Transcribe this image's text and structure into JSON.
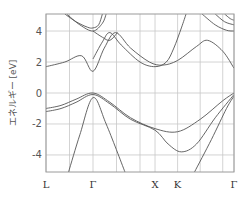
{
  "chart_data": {
    "type": "line",
    "title": "",
    "xlabel": "",
    "ylabel": "エネルギー [eV]",
    "ylim": [
      -5.1,
      5.1
    ],
    "yticks": [
      4,
      2,
      0,
      -2,
      -4
    ],
    "ytick_labels": [
      "4",
      "2",
      "0",
      "-2",
      "-4"
    ],
    "x_points": [
      {
        "label": "L",
        "pos": 0.0
      },
      {
        "label": "Γ",
        "pos": 0.25
      },
      {
        "label": "X",
        "pos": 0.58
      },
      {
        "label": "K",
        "pos": 0.7
      },
      {
        "label": "Γ",
        "pos": 1.0
      }
    ],
    "x_gridlines": [
      0.0,
      0.125,
      0.25,
      0.375,
      0.5,
      0.58,
      0.7,
      0.82,
      0.94,
      1.0
    ],
    "grid": true,
    "legend": null,
    "series": [
      {
        "name": "valence-1",
        "points": [
          [
            0,
            -1.0
          ],
          [
            0.08,
            -0.8
          ],
          [
            0.16,
            -0.4
          ],
          [
            0.25,
            0.0
          ],
          [
            0.34,
            -0.6
          ],
          [
            0.45,
            -1.6
          ],
          [
            0.58,
            -2.3
          ],
          [
            0.7,
            -2.5
          ],
          [
            0.82,
            -1.7
          ],
          [
            0.94,
            -0.5
          ],
          [
            1.0,
            0.0
          ]
        ]
      },
      {
        "name": "valence-2",
        "points": [
          [
            0,
            -1.2
          ],
          [
            0.08,
            -1.0
          ],
          [
            0.16,
            -0.6
          ],
          [
            0.25,
            -0.1
          ],
          [
            0.34,
            -0.7
          ],
          [
            0.45,
            -1.7
          ],
          [
            0.58,
            -2.4
          ],
          [
            0.65,
            -3.3
          ],
          [
            0.72,
            -3.8
          ],
          [
            0.8,
            -3.3
          ],
          [
            0.9,
            -1.6
          ],
          [
            1.0,
            -0.1
          ]
        ]
      },
      {
        "name": "valence-3",
        "points": [
          [
            0.12,
            -5.1
          ],
          [
            0.18,
            -2.7
          ],
          [
            0.25,
            -0.3
          ],
          [
            0.32,
            -2.0
          ],
          [
            0.42,
            -5.1
          ]
        ]
      },
      {
        "name": "valence-4",
        "points": [
          [
            0.79,
            -5.1
          ],
          [
            0.88,
            -3.0
          ],
          [
            0.96,
            -1.0
          ],
          [
            1.0,
            -0.2
          ]
        ]
      },
      {
        "name": "conduction-1",
        "points": [
          [
            0,
            1.7
          ],
          [
            0.1,
            2.0
          ],
          [
            0.19,
            2.4
          ],
          [
            0.25,
            1.4
          ],
          [
            0.31,
            2.9
          ],
          [
            0.37,
            3.9
          ],
          [
            0.45,
            2.9
          ],
          [
            0.55,
            2.0
          ],
          [
            0.62,
            1.8
          ],
          [
            0.7,
            2.1
          ],
          [
            0.8,
            3.0
          ],
          [
            0.86,
            3.4
          ],
          [
            0.94,
            2.7
          ],
          [
            1.0,
            1.6
          ]
        ]
      },
      {
        "name": "conduction-2",
        "points": [
          [
            0.25,
            2.2
          ],
          [
            0.3,
            3.3
          ],
          [
            0.34,
            3.9
          ],
          [
            0.4,
            3.1
          ],
          [
            0.5,
            2.0
          ],
          [
            0.58,
            1.7
          ],
          [
            0.64,
            2.0
          ],
          [
            0.68,
            2.9
          ],
          [
            0.72,
            4.2
          ],
          [
            0.745,
            5.1
          ]
        ]
      },
      {
        "name": "conduction-3",
        "points": [
          [
            0.1,
            5.1
          ],
          [
            0.16,
            4.6
          ],
          [
            0.22,
            4.25
          ],
          [
            0.25,
            4.2
          ],
          [
            0.28,
            4.4
          ],
          [
            0.3,
            5.1
          ]
        ]
      },
      {
        "name": "conduction-4",
        "points": [
          [
            0.11,
            5.1
          ],
          [
            0.18,
            4.4
          ],
          [
            0.25,
            4.0
          ],
          [
            0.3,
            4.5
          ],
          [
            0.32,
            5.1
          ]
        ]
      },
      {
        "name": "conduction-5",
        "points": [
          [
            0.25,
            4.0
          ],
          [
            0.3,
            3.6
          ],
          [
            0.34,
            3.4
          ],
          [
            0.38,
            3.9
          ]
        ]
      },
      {
        "name": "conduction-6",
        "points": [
          [
            0.83,
            5.1
          ],
          [
            0.9,
            4.4
          ],
          [
            0.96,
            4.05
          ],
          [
            1.0,
            4.0
          ]
        ]
      },
      {
        "name": "conduction-7",
        "points": [
          [
            0.9,
            5.1
          ],
          [
            0.95,
            4.6
          ],
          [
            1.0,
            4.4
          ]
        ]
      },
      {
        "name": "conduction-8",
        "points": [
          [
            0.95,
            5.1
          ],
          [
            0.98,
            4.8
          ],
          [
            1.0,
            4.7
          ]
        ]
      }
    ]
  },
  "layout": {
    "plot_left": 46,
    "plot_top": 14,
    "plot_right": 234,
    "plot_bottom": 172
  }
}
